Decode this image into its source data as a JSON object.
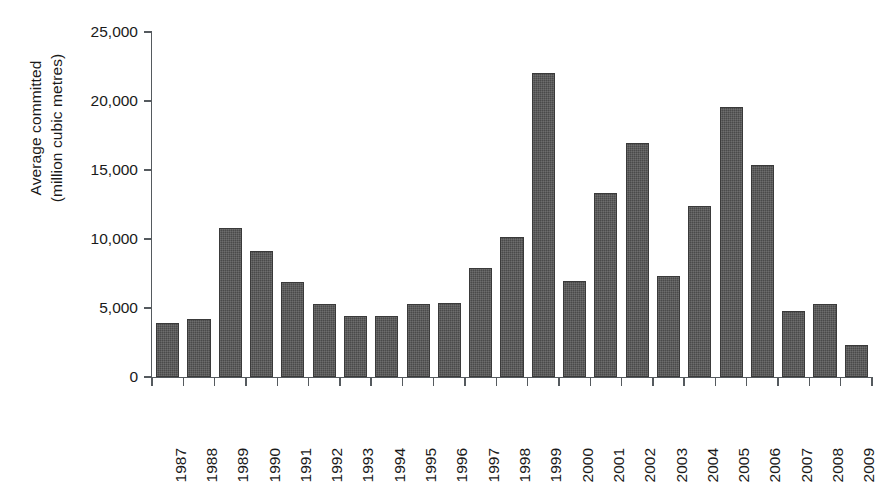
{
  "chart_data": {
    "type": "bar",
    "title": "",
    "subtitle": "",
    "xlabel": "",
    "ylabel": "Average committed (million cubic metres)",
    "ylabel_lines": [
      "Average committed",
      "(million cubic metres)"
    ],
    "categories": [
      "1987",
      "1988",
      "1989",
      "1990",
      "1991",
      "1992",
      "1993",
      "1994",
      "1995",
      "1996",
      "1997",
      "1998",
      "1999",
      "2000",
      "2001",
      "2002",
      "2003",
      "2004",
      "2005",
      "2006",
      "2007",
      "2008",
      "2009"
    ],
    "values": [
      3900,
      4200,
      10800,
      9150,
      6850,
      5300,
      4400,
      4450,
      5300,
      5350,
      7900,
      10150,
      22000,
      6950,
      13350,
      16950,
      7350,
      12400,
      19600,
      15350,
      4750,
      5300,
      2350
    ],
    "ylim": [
      0,
      25000
    ],
    "ytick_values": [
      0,
      5000,
      10000,
      15000,
      20000,
      25000
    ],
    "ytick_labels": [
      "0",
      "5,000",
      "10,000",
      "15,000",
      "20,000",
      "25,000"
    ],
    "xtick_labels": [
      "1987",
      "1988",
      "1989",
      "1990",
      "1991",
      "1992",
      "1993",
      "1994",
      "1995",
      "1996",
      "1997",
      "1998",
      "1999",
      "2000",
      "2001",
      "2002",
      "2003",
      "2004",
      "2005",
      "2006",
      "2007",
      "2008",
      "2009"
    ],
    "grid": false,
    "legend": null,
    "legend_position": "none",
    "bar_color": "#4a4a4a",
    "axis_color": "#555a5e",
    "text_color": "#1a1a1a",
    "xtick_rotation": -90,
    "annotations": []
  }
}
